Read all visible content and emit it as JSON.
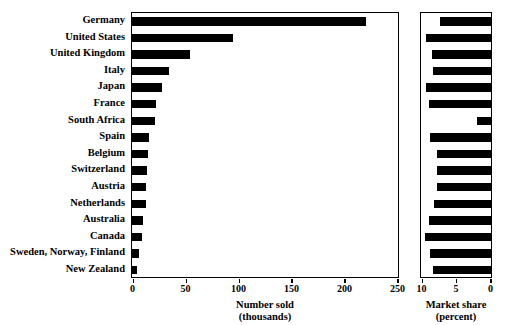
{
  "chart_data": {
    "type": "bar",
    "orientation": "horizontal",
    "title": "",
    "categories": [
      "Germany",
      "United States",
      "United Kingdom",
      "Italy",
      "Japan",
      "France",
      "South Africa",
      "Spain",
      "Belgium",
      "Switzerland",
      "Austria",
      "Netherlands",
      "Australia",
      "Canada",
      "Sweden, Norway, Finland",
      "New Zealand"
    ],
    "panels": [
      {
        "name": "number-sold",
        "xlabel_line1": "Number sold",
        "xlabel_line2": "(thousands)",
        "values": [
          221,
          95,
          55,
          35,
          28,
          23,
          22,
          16,
          15,
          14,
          13,
          13,
          10,
          9,
          7,
          5
        ],
        "xlim": [
          0,
          250
        ],
        "ticks": [
          0,
          50,
          100,
          150,
          200,
          250
        ],
        "tick_labels": [
          "0",
          "50",
          "100",
          "150",
          "200",
          "250"
        ],
        "grid": false
      },
      {
        "name": "market-share",
        "xlabel_line1": "Market share",
        "xlabel_line2": "(percent)",
        "values": [
          2.6,
          0.6,
          1.4,
          1.5,
          0.5,
          1.0,
          8.0,
          1.1,
          2.1,
          2.2,
          2.1,
          1.7,
          1.0,
          0.4,
          1.1,
          1.6
        ],
        "xlim": [
          10,
          0
        ],
        "reversed": true,
        "ticks": [
          10,
          5,
          0
        ],
        "tick_labels": [
          "10",
          "5",
          "0"
        ],
        "grid": false
      }
    ],
    "legend": [],
    "colors": {
      "bar": "#000000",
      "axis": "#000000",
      "background": "#ffffff"
    }
  }
}
